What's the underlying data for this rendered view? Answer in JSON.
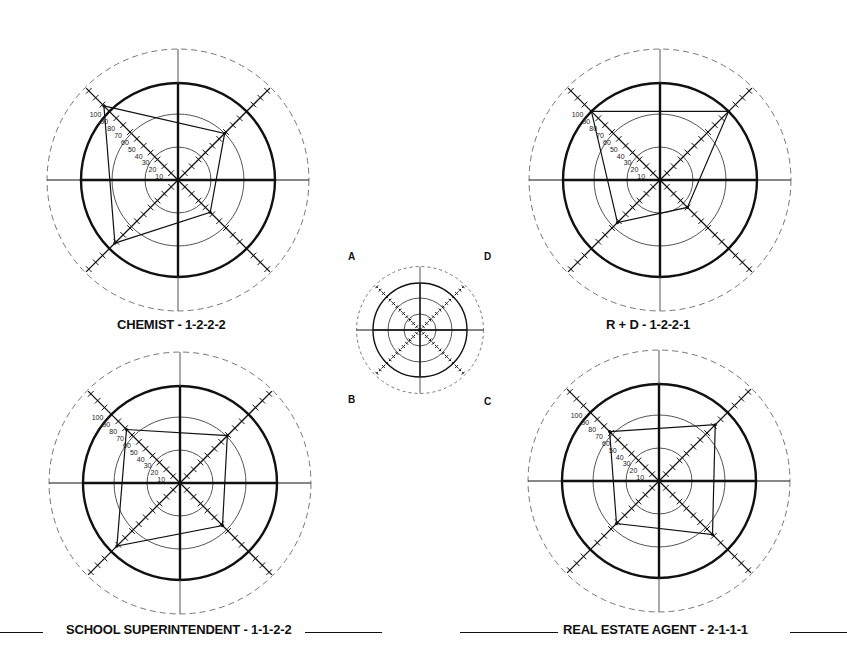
{
  "legend": {
    "corner_labels": {
      "A": "A",
      "B": "B",
      "C": "C",
      "D": "D"
    },
    "axes_order": [
      "A (top-left)",
      "D (top-right)",
      "C (bottom-right)",
      "B (bottom-left)"
    ]
  },
  "titles": {
    "chemist": "CHEMIST - 1-2-2-2",
    "rd": "R + D - 1-2-2-1",
    "school": "SCHOOL SUPERINTENDENT - 1-1-2-2",
    "realestate": "REAL ESTATE AGENT - 2-1-1-1"
  },
  "scale_labels": [
    "10",
    "20",
    "30",
    "40",
    "50",
    "60",
    "70",
    "80",
    "90",
    "100"
  ],
  "colors": {
    "ink": "#111111",
    "thin": "#555555",
    "dashed": "#777777"
  },
  "chart_data": [
    {
      "type": "radar",
      "title": "CHEMIST - 1-2-2-2",
      "axes": [
        "A",
        "D",
        "C",
        "B"
      ],
      "values": [
        108,
        68,
        47,
        92
      ],
      "scale": {
        "min": 0,
        "max": 130,
        "tick_step": 10,
        "labels_on_axis": "A"
      },
      "rings": [
        33,
        66,
        100
      ],
      "grid": true
    },
    {
      "type": "radar",
      "title": "R + D - 1-2-2-1",
      "axes": [
        "A",
        "D",
        "C",
        "B"
      ],
      "values": [
        100,
        100,
        40,
        62
      ],
      "scale": {
        "min": 0,
        "max": 130,
        "tick_step": 10,
        "labels_on_axis": "A"
      },
      "rings": [
        33,
        66,
        100
      ],
      "grid": true
    },
    {
      "type": "radar",
      "title": "SCHOOL SUPERINTENDENT - 1-1-2-2",
      "axes": [
        "A",
        "D",
        "C",
        "B"
      ],
      "values": [
        78,
        69,
        62,
        92
      ],
      "scale": {
        "min": 0,
        "max": 130,
        "tick_step": 10,
        "labels_on_axis": "A"
      },
      "rings": [
        33,
        66,
        100
      ],
      "grid": true
    },
    {
      "type": "radar",
      "title": "REAL ESTATE AGENT - 2-1-1-1",
      "axes": [
        "A",
        "D",
        "C",
        "B"
      ],
      "values": [
        72,
        82,
        78,
        62
      ],
      "scale": {
        "min": 0,
        "max": 130,
        "tick_step": 10,
        "labels_on_axis": "A"
      },
      "rings": [
        33,
        66,
        100
      ],
      "grid": true
    }
  ]
}
